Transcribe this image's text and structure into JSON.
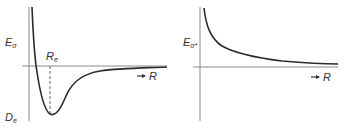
{
  "colors": {
    "axis": "#8a8a8a",
    "curve": "#2a2a2a",
    "text": "#333333",
    "background": "#ffffff"
  },
  "left_panel": {
    "title": "Bonding potential energy curve",
    "y_label": {
      "main": "E",
      "sub": "σ"
    },
    "equilibrium_label": {
      "main": "R",
      "sub": "e"
    },
    "depth_label": {
      "main": "D",
      "sub": "e"
    },
    "x_label": {
      "arrow": "➞",
      "main": "R"
    }
  },
  "right_panel": {
    "title": "Antibonding potential energy curve",
    "y_label": {
      "main": "E",
      "sub": "σ*"
    },
    "x_label": {
      "arrow": "➞",
      "main": "R"
    }
  }
}
